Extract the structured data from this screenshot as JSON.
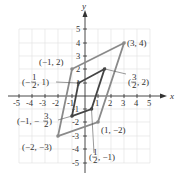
{
  "axes": {
    "x_label": "x",
    "y_label": "y",
    "x_ticks": [
      "-5",
      "-4",
      "-3",
      "-2",
      "-1",
      "1",
      "2",
      "3",
      "4",
      "5"
    ],
    "y_ticks": [
      "5",
      "4",
      "3",
      "2",
      "1",
      "-1",
      "-2",
      "-3",
      "-4",
      "-5"
    ],
    "range": {
      "xmin": -5,
      "xmax": 5,
      "ymin": -5,
      "ymax": 5
    }
  },
  "outer_parallelogram": {
    "color": "#888888",
    "vertices": [
      {
        "x": 3,
        "y": 4,
        "label": "(3, 4)"
      },
      {
        "x": -1,
        "y": 2,
        "label": "(−1, 2)"
      },
      {
        "x": -2,
        "y": -3,
        "label": "(−2, −3)"
      },
      {
        "x": 1,
        "y": -2,
        "label": "(1, −2)"
      }
    ]
  },
  "inner_parallelogram": {
    "color": "#444444",
    "vertices": [
      {
        "x": 1.5,
        "y": 2,
        "label_main": "3",
        "label_den": "2",
        "label_rest": ", 2)"
      },
      {
        "x": -0.5,
        "y": 1,
        "label_main": "1",
        "label_den": "2",
        "label_rest": ", 1)"
      },
      {
        "x": -1,
        "y": -1.5,
        "label_pre": "(−1, −",
        "label_main": "3",
        "label_den": "2"
      },
      {
        "x": 0.5,
        "y": -1,
        "label_main": "1",
        "label_den": "2",
        "label_rest": ", −1)"
      }
    ]
  },
  "labels": {
    "p34": "(3, 4)",
    "pm12": "(−1, 2)",
    "pm2m3": "(−2, −3)",
    "p1m2": "(1, −2)",
    "half_pre": "(−",
    "frac_1": "1",
    "frac_2": "2",
    "frac_3": "3",
    "rest_1": ", 1)",
    "rest_2": ", 2)",
    "rest_m1": ", −1)",
    "pre_m1": "(−1, −",
    "close": ")",
    "open": "("
  }
}
